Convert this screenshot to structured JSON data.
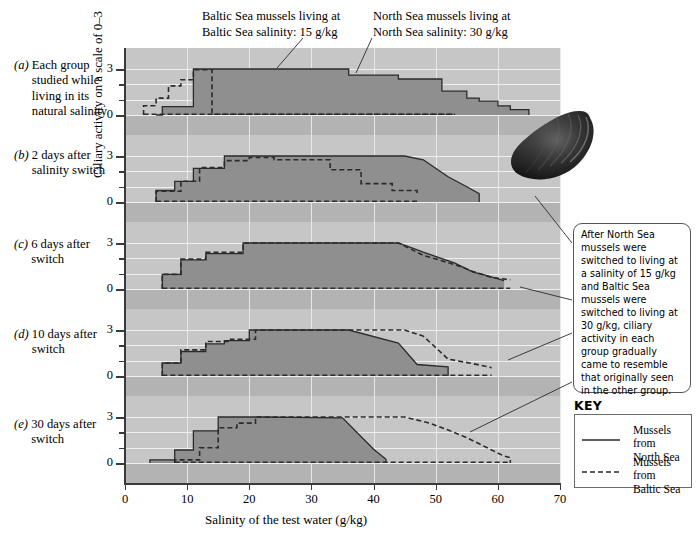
{
  "figure": {
    "y_axis_title": "Ciliary activity on a scale of 0–3",
    "x_axis_title": "Salinity of the test water (g/kg)",
    "mussel_photo_name": "mussel-shell-photo"
  },
  "callouts": [
    {
      "id": "baltic-callout",
      "line1": "Baltic Sea mussels living at",
      "line2": "Baltic Sea salinity: 15 g/kg"
    },
    {
      "id": "northsea-callout",
      "line1": "North Sea mussels living at",
      "line2": "North Sea salinity: 30 g/kg"
    }
  ],
  "panels": [
    {
      "tag": "(a)",
      "caption": "Each group studied while living in its natural salinity"
    },
    {
      "tag": "(b)",
      "caption": "2 days after salinity switch"
    },
    {
      "tag": "(c)",
      "caption": "6 days after switch"
    },
    {
      "tag": "(d)",
      "caption": "10 days after switch"
    },
    {
      "tag": "(e)",
      "caption": "30 days after switch"
    }
  ],
  "side_note": {
    "text": "After North Sea mussels were switched to living at a salinity of 15 g/kg and Baltic Sea mussels were switched to living at 30 g/kg, ciliary activity in each group gradually came to resemble that originally seen in the other group."
  },
  "key": {
    "title": "KEY",
    "entries": [
      {
        "style": "solid",
        "label_line1": "Mussels from",
        "label_line2": "North Sea"
      },
      {
        "style": "dashed",
        "label_line1": "Mussels from",
        "label_line2": "Baltic Sea"
      }
    ]
  },
  "colors": {
    "plot_background": "#b3b3b3",
    "panel_band": "#c6c6c6",
    "fill_north_sea": "#8f8f8f",
    "line_color": "#2b2b2b",
    "grid": "#efefef"
  },
  "chart_data": {
    "type": "area",
    "title": "",
    "xlabel": "Salinity of the test water (g/kg)",
    "ylabel": "Ciliary activity on a scale of 0–3",
    "xlim": [
      0,
      70
    ],
    "ylim": [
      0,
      3.3
    ],
    "xticks": [
      0,
      10,
      20,
      30,
      40,
      50,
      60,
      70
    ],
    "yticks": [
      0,
      1,
      2,
      3
    ],
    "ytick_labels": [
      "0",
      "",
      "",
      "3"
    ],
    "grid": true,
    "legend": [
      "Mussels from North Sea",
      "Mussels from Baltic Sea"
    ],
    "legend_position": "right",
    "note": "Step (staircase) curves. Each panel plots ciliary activity (0-3) against test-water salinity for two mussel populations.",
    "panels": [
      {
        "tag": "(a)",
        "label": "Each group studied while living in its natural salinity",
        "series": [
          {
            "name": "Mussels from North Sea",
            "style": "solid",
            "x": [
              5,
              6,
              6,
              11,
              11,
              14,
              14,
              24,
              24,
              36,
              36,
              44,
              44,
              51,
              51,
              55,
              55,
              57,
              57,
              60,
              60,
              62,
              62,
              65,
              65
            ],
            "y": [
              0,
              0,
              0.55,
              0.55,
              3,
              3,
              3,
              3,
              3,
              3,
              2.6,
              2.6,
              2.35,
              2.35,
              1.55,
              1.55,
              1.1,
              1.1,
              0.9,
              0.9,
              0.6,
              0.6,
              0.35,
              0.35,
              0
            ]
          },
          {
            "name": "Mussels from Baltic Sea",
            "style": "dashed",
            "x": [
              3,
              3,
              5,
              5,
              7,
              7,
              9,
              9,
              11,
              11,
              14,
              14,
              41,
              41,
              45,
              45,
              48,
              48,
              53,
              53
            ],
            "y": [
              0,
              0.6,
              0.6,
              1.1,
              1.1,
              1.9,
              1.9,
              2.3,
              2.3,
              2.95,
              2.95,
              0.05,
              0.05,
              0.05,
              0.05,
              0.05,
              0.05,
              0.05,
              0.05,
              0
            ]
          }
        ]
      },
      {
        "tag": "(b)",
        "label": "2 days after salinity switch",
        "series": [
          {
            "name": "Mussels from North Sea",
            "style": "solid",
            "x": [
              5,
              5,
              8,
              8,
              11,
              11,
              16,
              16,
              45,
              45,
              48,
              48,
              50,
              50,
              52,
              52,
              55,
              55,
              57,
              57
            ],
            "y": [
              0,
              0.75,
              0.75,
              1.35,
              1.35,
              2.2,
              2.2,
              3,
              3,
              3,
              2.75,
              2.75,
              2.2,
              2.2,
              1.65,
              1.65,
              1.0,
              1.0,
              0.55,
              0
            ]
          },
          {
            "name": "Mussels from Baltic Sea",
            "style": "dashed",
            "x": [
              5,
              5,
              9,
              9,
              12,
              12,
              16,
              16,
              20,
              20,
              24,
              24,
              33,
              33,
              38,
              38,
              43,
              43,
              47,
              47
            ],
            "y": [
              0,
              0.7,
              0.7,
              1.35,
              1.35,
              2.25,
              2.25,
              2.7,
              2.7,
              2.9,
              2.9,
              2.75,
              2.75,
              2.1,
              2.1,
              1.2,
              1.2,
              0.75,
              0.75,
              0.55
            ]
          }
        ]
      },
      {
        "tag": "(c)",
        "label": "6 days after switch",
        "series": [
          {
            "name": "Mussels from North Sea",
            "style": "solid",
            "x": [
              6,
              6,
              9,
              9,
              13,
              13,
              19,
              19,
              44,
              44,
              48,
              48,
              53,
              53,
              56,
              56,
              58,
              58,
              61,
              61
            ],
            "y": [
              0,
              0.95,
              0.95,
              1.9,
              1.9,
              2.3,
              2.3,
              3,
              3,
              3,
              2.4,
              2.4,
              1.7,
              1.7,
              1.1,
              1.1,
              0.9,
              0.9,
              0.55,
              0.55
            ]
          },
          {
            "name": "Mussels from Baltic Sea",
            "style": "dashed",
            "x": [
              6,
              6,
              9,
              9,
              13,
              13,
              19,
              19,
              44,
              44,
              48,
              48,
              53,
              53,
              56,
              56,
              59,
              59,
              62,
              62
            ],
            "y": [
              0,
              0.95,
              0.95,
              1.95,
              1.95,
              2.4,
              2.4,
              3,
              3,
              3,
              2.2,
              2.2,
              1.6,
              1.6,
              1.15,
              1.15,
              0.75,
              0.75,
              0.6,
              0.6
            ]
          }
        ]
      },
      {
        "tag": "(d)",
        "label": "10 days after switch",
        "series": [
          {
            "name": "Mussels from North Sea",
            "style": "solid",
            "x": [
              6,
              6,
              9,
              9,
              13,
              13,
              16,
              16,
              20,
              20,
              36,
              36,
              44,
              44,
              47,
              47,
              52,
              52
            ],
            "y": [
              0,
              0.85,
              0.85,
              1.6,
              1.6,
              2.1,
              2.1,
              2.3,
              2.3,
              3,
              3,
              3,
              2.15,
              2.15,
              0.75,
              0.75,
              0.6,
              0
            ]
          },
          {
            "name": "Mussels from Baltic Sea",
            "style": "dashed",
            "x": [
              6,
              6,
              9,
              9,
              13,
              13,
              17,
              17,
              21,
              21,
              45,
              45,
              48,
              48,
              52,
              52,
              56,
              56,
              59,
              59
            ],
            "y": [
              0,
              0.85,
              0.85,
              1.7,
              1.7,
              2.25,
              2.25,
              2.4,
              2.4,
              3,
              3,
              3,
              2.6,
              2.6,
              1.1,
              1.1,
              0.8,
              0.8,
              0.55,
              0.55
            ]
          }
        ]
      },
      {
        "tag": "(e)",
        "label": "30 days after switch",
        "series": [
          {
            "name": "Mussels from North Sea",
            "style": "solid",
            "x": [
              4,
              4,
              8,
              8,
              11,
              11,
              15,
              15,
              22,
              22,
              35,
              35,
              40,
              40,
              42,
              42
            ],
            "y": [
              0,
              0.2,
              0.2,
              0.85,
              0.85,
              2.1,
              2.1,
              3,
              3,
              3,
              2.95,
              2.95,
              0.9,
              0.9,
              0.25,
              0
            ]
          },
          {
            "name": "Mussels from Baltic Sea",
            "style": "dashed",
            "x": [
              8,
              8,
              12,
              12,
              15,
              15,
              18,
              18,
              21,
              21,
              45,
              45,
              49,
              49,
              52,
              52,
              55,
              55,
              57,
              57,
              59,
              59,
              61,
              61,
              62,
              62
            ],
            "y": [
              0,
              0.2,
              0.2,
              1.0,
              1.0,
              2.3,
              2.3,
              2.6,
              2.6,
              3,
              3,
              3,
              2.6,
              2.6,
              2.15,
              2.15,
              1.65,
              1.65,
              1.25,
              1.25,
              0.85,
              0.85,
              0.45,
              0.45,
              0.35,
              0
            ]
          }
        ]
      }
    ]
  }
}
